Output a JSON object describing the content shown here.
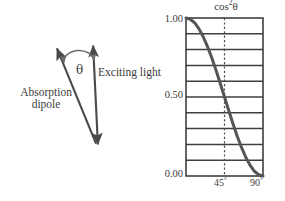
{
  "figure": {
    "width": 285,
    "height": 201,
    "background": "#ffffff",
    "ink_color": "#4a4a4a",
    "text_color": "#3b3b3b"
  },
  "diagram": {
    "name": "dipole-excitation-angle-diagram",
    "absorption_dipole_label": {
      "line1": "Absorption",
      "line2": "dipole"
    },
    "exciting_light_label": "Exciting light",
    "angle_symbol": "θ",
    "arrows": [
      {
        "name": "absorption-dipole-arrow",
        "heads": "start",
        "from_x": 97,
        "from_y": 146,
        "to_x": 56,
        "to_y": 46
      },
      {
        "name": "exciting-light-arrow",
        "heads": "both",
        "from_x": 93,
        "from_y": 43,
        "to_x": 98,
        "to_y": 147
      }
    ],
    "angle_arc": {
      "name": "theta-arc",
      "heads": "both",
      "cx": 79,
      "cy": 64,
      "rx": 15,
      "ry": 11
    }
  },
  "chart_data": {
    "type": "line",
    "title_base": "cos",
    "title_exponent": "2",
    "title_variable": "θ",
    "xlabel": "",
    "ylabel": "",
    "xlim": [
      0,
      90
    ],
    "ylim": [
      0,
      1
    ],
    "grid": true,
    "grid_orientation": "horizontal",
    "grid_divisions": 10,
    "legend": "none",
    "x_unit": "degrees",
    "x_ticks": [
      {
        "value": 45,
        "label": "45",
        "unit": "°"
      },
      {
        "value": 90,
        "label": "90",
        "unit": "°"
      }
    ],
    "y_ticks": [
      {
        "value": 1.0,
        "label": "1.00"
      },
      {
        "value": 0.5,
        "label": "0.50"
      },
      {
        "value": 0.0,
        "label": "0.00"
      }
    ],
    "annotations": [
      {
        "name": "forty-five-degree-guide",
        "type": "vertical-dashed-line",
        "x": 45,
        "style": "dashed"
      }
    ],
    "series": [
      {
        "name": "cos²θ",
        "color": "#555555",
        "linewidth": 3,
        "x": [
          0,
          5,
          10,
          15,
          20,
          25,
          30,
          35,
          40,
          45,
          50,
          55,
          60,
          65,
          70,
          75,
          80,
          85,
          90
        ],
        "values": [
          1.0,
          0.992,
          0.97,
          0.933,
          0.883,
          0.821,
          0.75,
          0.671,
          0.587,
          0.5,
          0.413,
          0.329,
          0.25,
          0.179,
          0.117,
          0.067,
          0.03,
          0.008,
          0.0
        ]
      }
    ],
    "plot_box": {
      "left": 186,
      "top": 18,
      "right": 263,
      "bottom": 176
    }
  }
}
